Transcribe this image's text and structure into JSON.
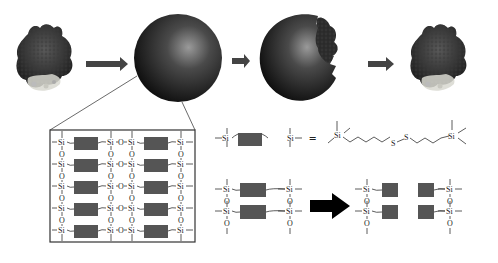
{
  "diagram": {
    "type": "process-schematic",
    "steps": [
      {
        "id": "protein",
        "name": "Protein"
      },
      {
        "id": "nanoparticle",
        "name": "Silica nanoparticle (protein encapsulated)"
      },
      {
        "id": "degrading-nanoparticle",
        "name": "Nanoparticle breaking open, releasing protein"
      },
      {
        "id": "released-protein",
        "name": "Released protein"
      }
    ],
    "arrows": [
      {
        "from": "protein",
        "to": "nanoparticle"
      },
      {
        "from": "nanoparticle",
        "to": "degrading-nanoparticle"
      },
      {
        "from": "degrading-nanoparticle",
        "to": "released-protein"
      }
    ],
    "network_inset": {
      "atom_si": "Si",
      "atom_o": "O",
      "rows": 5
    },
    "linker_definition": {
      "left_atom": "Si",
      "right_atom": "Si",
      "equals": "=",
      "sulfur_1": "S",
      "sulfur_2": "S",
      "si_left": "Si",
      "si_right": "Si"
    },
    "cleavage": {
      "atom_si": "Si",
      "atom_o": "O"
    },
    "colors": {
      "sphere_dark": "#111111",
      "sphere_highlight": "#8a8a8a",
      "linker_block": "#555555",
      "arrow": "#444444",
      "big_arrow": "#000000"
    }
  }
}
